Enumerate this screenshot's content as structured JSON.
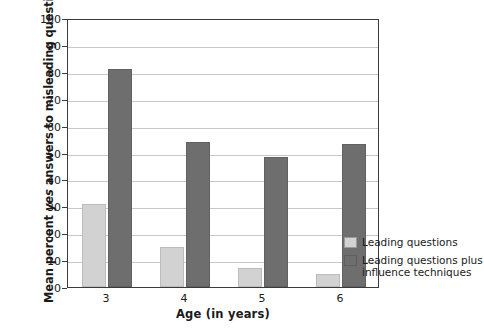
{
  "chart_data": {
    "type": "bar",
    "title": "",
    "xlabel": "Age (in years)",
    "ylabel_prefix": "Mean percent ",
    "ylabel_italic": "yes",
    "ylabel_suffix": " answers to misleading questions",
    "ylabel_full": "Mean percent yes answers to misleading questions",
    "categories": [
      "3",
      "4",
      "5",
      "6"
    ],
    "ylim": [
      0,
      100
    ],
    "yticks": [
      0,
      10,
      20,
      30,
      40,
      50,
      60,
      70,
      80,
      90,
      100
    ],
    "grid": true,
    "legend_position": "right",
    "series": [
      {
        "name": "Leading questions",
        "color": "#d2d2d2",
        "values": [
          31,
          15,
          7,
          5
        ]
      },
      {
        "name": "Leading questions plus\ninfluence techniques",
        "color": "#6e6e6e",
        "values": [
          81,
          54,
          48.5,
          53
        ]
      }
    ]
  },
  "legend": {
    "items": [
      {
        "label": "Leading questions",
        "swatch": "light"
      },
      {
        "label": "Leading questions plus\ninfluence techniques",
        "swatch": "dark"
      }
    ]
  },
  "colors": {
    "light_bar": "#d2d2d2",
    "dark_bar": "#6e6e6e",
    "axis": "#3b3b3b",
    "gridline": "#c8c8c8",
    "background": "#ffffff"
  }
}
